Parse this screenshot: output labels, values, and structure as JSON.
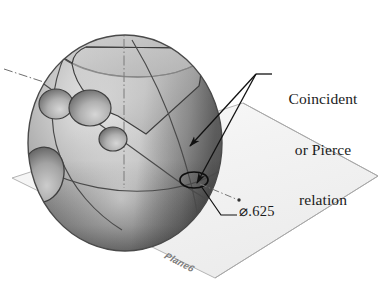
{
  "figure": {
    "type": "cad-technical-illustration",
    "title_visible": false,
    "background_color": "#ffffff"
  },
  "annotations": {
    "callout": {
      "name": "coincident-or-pierce-relation",
      "line1": "Coincident",
      "line2": "or Pierce",
      "line3": "relation",
      "text_color": "#1b1b1b"
    },
    "dimension": {
      "name": "diameter-dimension",
      "symbol": "⌀",
      "value": ".625",
      "full": "⌀.625",
      "text_color": "#1b1b1b"
    },
    "plane_label": {
      "name": "plane-label",
      "text": "Plane6",
      "text_color": "#7e7e7e"
    }
  },
  "geometry": {
    "sphere": {
      "name": "sphere-body",
      "center_x": 125,
      "center_y": 143,
      "radius_x": 97,
      "radius_y": 108,
      "fill_light": "#e3e3e3",
      "fill_mid": "#a9a9a9",
      "fill_dark": "#6f6f6f",
      "outline_color": "#4a4a4a"
    },
    "plane": {
      "name": "reference-plane",
      "points": "12,178 243,103 378,176 215,278",
      "fill": "#f4f4f4",
      "stroke": "#b4b4b4"
    },
    "pierce_circle": {
      "name": "pierce-point-circle",
      "cx": 194,
      "cy": 180,
      "rx": 14,
      "ry": 8,
      "stroke": "#111111"
    },
    "axis_lines": {
      "name": "construction-axes",
      "style": "dash-dot",
      "color": "#777777"
    },
    "leader_lines": {
      "name": "leader-lines",
      "color": "#111111",
      "origin_x": 256,
      "origin_y": 74
    }
  },
  "colors": {
    "ink": "#111111",
    "sphere_highlight": "#ededed",
    "sphere_shadow": "#5f5f5f",
    "plane_fill": "#f4f4f4",
    "plane_edge": "#b0b0b0",
    "axis": "#808080"
  }
}
